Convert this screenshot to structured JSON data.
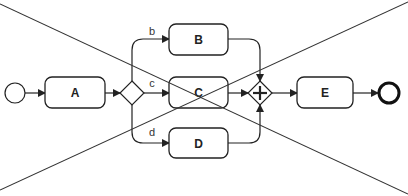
{
  "diagram": {
    "type": "bpmn-process",
    "crossed_out": true,
    "colors": {
      "stroke": "#222222",
      "background": "#ffffff",
      "cross": "#333333"
    },
    "events": {
      "start": {
        "label": ""
      },
      "end": {
        "label": ""
      }
    },
    "tasks": {
      "a": {
        "label": "A"
      },
      "b": {
        "label": "B"
      },
      "c": {
        "label": "C"
      },
      "d": {
        "label": "D"
      },
      "e": {
        "label": "E"
      }
    },
    "gateways": {
      "split": {
        "kind": "exclusive"
      },
      "join": {
        "kind": "parallel",
        "symbol": "+"
      }
    },
    "flows": {
      "b": {
        "label": "b"
      },
      "c": {
        "label": "c"
      },
      "d": {
        "label": "d"
      }
    }
  }
}
